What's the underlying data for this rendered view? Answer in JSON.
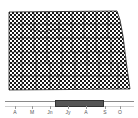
{
  "map": {
    "region": "north-dakota-counties",
    "fill_pattern": "checkerboard",
    "pattern_colors": [
      "#1a1a1a",
      "#ffffff"
    ],
    "border_color": "#222222"
  },
  "timeline": {
    "months": [
      {
        "label": "A",
        "x": 15
      },
      {
        "label": "M",
        "x": 32
      },
      {
        "label": "Jn",
        "x": 50
      },
      {
        "label": "Jy",
        "x": 68
      },
      {
        "label": "A",
        "x": 86
      },
      {
        "label": "S",
        "x": 105
      },
      {
        "label": "O",
        "x": 120
      }
    ],
    "selected_range": {
      "start_x": 55,
      "end_x": 104,
      "from": "Jn",
      "to": "S"
    },
    "bar_color": "#555555"
  }
}
